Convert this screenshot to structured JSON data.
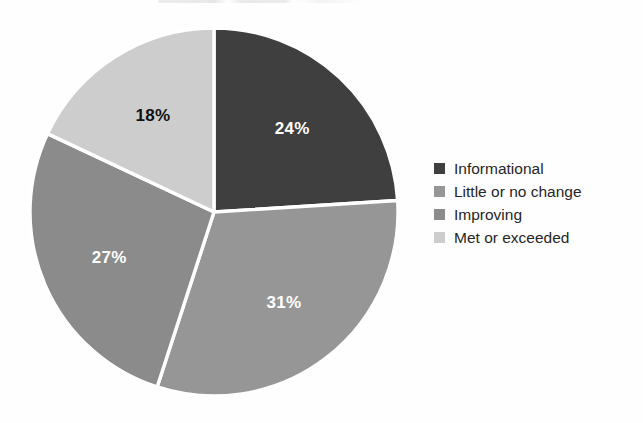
{
  "chart_data": {
    "type": "pie",
    "title": "",
    "labels": [
      "Informational",
      "Little or no change",
      "Improving",
      "Met or exceeded"
    ],
    "values": [
      24,
      31,
      27,
      18
    ],
    "value_labels": [
      "24%",
      "31%",
      "27%",
      "18%"
    ],
    "units": "percent",
    "start_angle_deg": 0,
    "direction": "clockwise",
    "colors": [
      "#3f3f3f",
      "#969696",
      "#8b8b8b",
      "#cdcdcd"
    ],
    "label_text_colors": [
      "#ffffff",
      "#ffffff",
      "#ffffff",
      "#111111"
    ],
    "separator_color": "#ffffff",
    "legend": {
      "position": "right",
      "entries": [
        {
          "label": "Informational",
          "color": "#3f3f3f",
          "value_label": "24%"
        },
        {
          "label": "Little or no change",
          "color": "#969696",
          "value_label": "31%"
        },
        {
          "label": "Improving",
          "color": "#8b8b8b",
          "value_label": "27%"
        },
        {
          "label": "Met or exceeded",
          "color": "#cdcdcd",
          "value_label": "18%"
        }
      ]
    }
  },
  "figure": {
    "background": "#fefefe"
  }
}
